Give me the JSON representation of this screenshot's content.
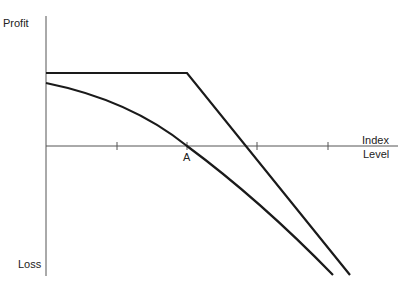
{
  "diagram": {
    "y_axis": {
      "top_label": "Profit",
      "bottom_label": "Loss"
    },
    "x_axis": {
      "label_line1": "Index",
      "label_line2": "Level",
      "ticks": 4
    },
    "points": {
      "A": "A"
    },
    "curves": [
      {
        "name": "kinked-payoff-line",
        "description": "flat then declining linear payoff"
      },
      {
        "name": "concave-curve",
        "description": "curved payoff crossing axis at A"
      }
    ]
  }
}
